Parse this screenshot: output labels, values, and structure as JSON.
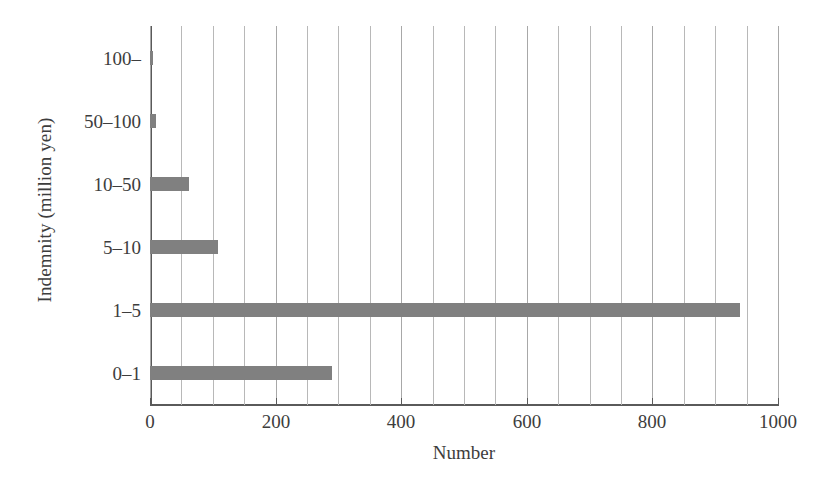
{
  "chart_data": {
    "type": "bar",
    "orientation": "horizontal",
    "title": "",
    "xlabel": "Number",
    "ylabel": "Indemnity (million yen)",
    "categories": [
      "100–",
      "50–100",
      "10–50",
      "5–10",
      "1–5",
      "0–1"
    ],
    "values": [
      5,
      10,
      62,
      108,
      940,
      290
    ],
    "xlim": [
      0,
      1000
    ],
    "x_tick_labels": [
      "0",
      "200",
      "400",
      "600",
      "800",
      "1000"
    ],
    "x_tick_values": [
      0,
      200,
      400,
      600,
      800,
      1000
    ],
    "x_minor_gridline_step": 50,
    "grid": "vertical-only",
    "legend": "none",
    "bar_color": "#808080",
    "gridline_color": "#b8b8b8",
    "axis_color": "#5a5a5a",
    "background_color": "#ffffff"
  }
}
